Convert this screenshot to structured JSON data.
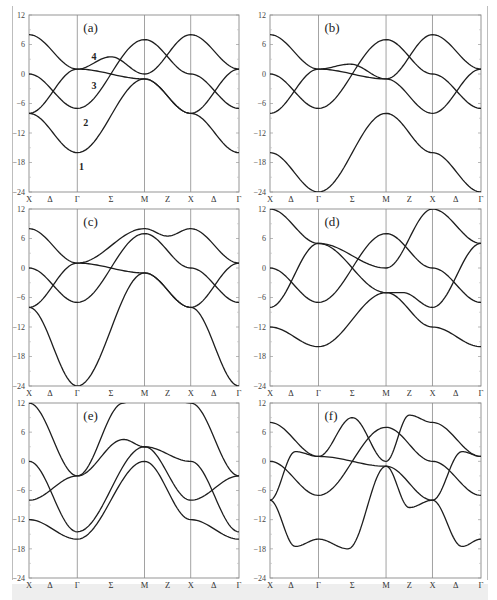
{
  "figure": {
    "ylim": [
      -24,
      12
    ],
    "yticks": [
      12,
      6,
      0,
      -6,
      -12,
      -18,
      -24
    ],
    "ytick_labels": [
      "12",
      "6",
      "0",
      "−6",
      "−12",
      "−18",
      "−24"
    ],
    "k_labels": [
      "X",
      "Δ",
      "Γ",
      "Σ",
      "M",
      "Z",
      "X",
      "Δ",
      "Γ"
    ],
    "k_positions": [
      0,
      0.1,
      0.23,
      0.39,
      0.55,
      0.66,
      0.77,
      0.88,
      1.0
    ],
    "high_symmetry_lines": [
      0.23,
      0.55,
      0.77
    ]
  },
  "chart_data": [
    {
      "type": "line",
      "title": "(a)",
      "xlabel": "",
      "ylabel": "",
      "ylim": [
        -24,
        12
      ],
      "x_ticks": [
        "X",
        "Δ",
        "Γ",
        "Σ",
        "M",
        "Z",
        "X",
        "Δ",
        "Γ"
      ],
      "annotations": [
        {
          "text": "1",
          "x": 0.25,
          "y": -19
        },
        {
          "text": "2",
          "x": 0.27,
          "y": -10
        },
        {
          "text": "3",
          "x": 0.31,
          "y": -2.5
        },
        {
          "text": "4",
          "x": 0.31,
          "y": 3.5
        }
      ],
      "series": [
        {
          "name": "band 1",
          "x": [
            0,
            0.23,
            0.55,
            0.77,
            1.0
          ],
          "y": [
            -8,
            -16,
            -1,
            -8,
            -16
          ]
        },
        {
          "name": "band 2",
          "x": [
            0,
            0.23,
            0.55,
            0.77,
            1.0
          ],
          "y": [
            0,
            -7,
            7,
            0,
            -7
          ]
        },
        {
          "name": "band 3",
          "x": [
            0,
            0.23,
            0.55,
            0.77,
            1.0
          ],
          "y": [
            -8,
            1,
            -1,
            -8,
            1
          ]
        },
        {
          "name": "band 4",
          "x": [
            0,
            0.23,
            0.39,
            0.55,
            0.77,
            1.0
          ],
          "y": [
            8,
            1,
            3.5,
            0,
            8,
            1
          ]
        }
      ]
    },
    {
      "type": "line",
      "title": "(b)",
      "ylim": [
        -24,
        12
      ],
      "x_ticks": [
        "X",
        "Δ",
        "Γ",
        "Σ",
        "M",
        "Z",
        "X",
        "Δ",
        "Γ"
      ],
      "series": [
        {
          "name": "band 1",
          "x": [
            0,
            0.23,
            0.55,
            0.77,
            1.0
          ],
          "y": [
            -16,
            -24,
            -8,
            -16,
            -24
          ]
        },
        {
          "name": "band 2",
          "x": [
            0,
            0.23,
            0.55,
            0.77,
            1.0
          ],
          "y": [
            0,
            -7,
            7,
            0,
            -7
          ]
        },
        {
          "name": "band 3",
          "x": [
            0,
            0.23,
            0.55,
            0.77,
            1.0
          ],
          "y": [
            -8,
            1,
            -1,
            -8,
            1
          ]
        },
        {
          "name": "band 4",
          "x": [
            0,
            0.23,
            0.38,
            0.55,
            0.77,
            1.0
          ],
          "y": [
            8,
            1,
            2,
            -1,
            8,
            1
          ]
        }
      ]
    },
    {
      "type": "line",
      "title": "(c)",
      "ylim": [
        -24,
        12
      ],
      "x_ticks": [
        "X",
        "Δ",
        "Γ",
        "Σ",
        "M",
        "Z",
        "X",
        "Δ",
        "Γ"
      ],
      "series": [
        {
          "name": "band 1",
          "x": [
            0,
            0.23,
            0.55,
            0.77,
            1.0
          ],
          "y": [
            -8,
            -24,
            -1,
            -8,
            -24
          ]
        },
        {
          "name": "band 2",
          "x": [
            0,
            0.23,
            0.55,
            0.77,
            1.0
          ],
          "y": [
            0,
            -7,
            7,
            0,
            -7
          ]
        },
        {
          "name": "band 3",
          "x": [
            0,
            0.23,
            0.55,
            0.77,
            1.0
          ],
          "y": [
            -8,
            1,
            -1,
            -8,
            1
          ]
        },
        {
          "name": "band 4",
          "x": [
            0,
            0.23,
            0.55,
            0.66,
            0.77,
            1.0
          ],
          "y": [
            8,
            1,
            8,
            6.5,
            8,
            1
          ]
        }
      ]
    },
    {
      "type": "line",
      "title": "(d)",
      "ylim": [
        -24,
        12
      ],
      "x_ticks": [
        "X",
        "Δ",
        "Γ",
        "Σ",
        "M",
        "Z",
        "X",
        "Δ",
        "Γ"
      ],
      "series": [
        {
          "name": "band 1",
          "x": [
            0,
            0.23,
            0.55,
            0.77,
            1.0
          ],
          "y": [
            -12,
            -16,
            -5,
            -12,
            -16
          ]
        },
        {
          "name": "band 2",
          "x": [
            0,
            0.23,
            0.55,
            0.77,
            1.0
          ],
          "y": [
            0,
            -7,
            7,
            0,
            -7
          ]
        },
        {
          "name": "band 3",
          "x": [
            0,
            0.23,
            0.55,
            0.63,
            0.77,
            1.0
          ],
          "y": [
            -8,
            5,
            -5,
            -5,
            -8,
            5
          ]
        },
        {
          "name": "band 4",
          "x": [
            0,
            0.23,
            0.55,
            0.77,
            1.0
          ],
          "y": [
            12,
            5,
            0,
            12,
            5
          ]
        }
      ]
    },
    {
      "type": "line",
      "title": "(e)",
      "ylim": [
        -24,
        12
      ],
      "x_ticks": [
        "X",
        "Δ",
        "Γ",
        "Σ",
        "M",
        "Z",
        "X",
        "Δ",
        "Γ"
      ],
      "series": [
        {
          "name": "band 1",
          "x": [
            0,
            0.23,
            0.55,
            0.77,
            1.0
          ],
          "y": [
            -12,
            -16,
            0,
            -12,
            -16
          ]
        },
        {
          "name": "band 2",
          "x": [
            0,
            0.23,
            0.55,
            0.77,
            1.0
          ],
          "y": [
            0,
            -14.5,
            3,
            -8,
            -3
          ]
        },
        {
          "name": "band 3",
          "x": [
            0,
            0.23,
            0.45,
            0.55,
            0.77,
            1.0
          ],
          "y": [
            -8,
            -3,
            4.5,
            3,
            0,
            -14.5
          ]
        },
        {
          "name": "band 4",
          "x": [
            0,
            0.23,
            0.45,
            0.55,
            0.77,
            1.0
          ],
          "y": [
            12,
            -3,
            12,
            16,
            12,
            -3
          ]
        }
      ]
    },
    {
      "type": "line",
      "title": "(f)",
      "ylim": [
        -24,
        12
      ],
      "x_ticks": [
        "X",
        "Δ",
        "Γ",
        "Σ",
        "M",
        "Z",
        "X",
        "Δ",
        "Γ"
      ],
      "series": [
        {
          "name": "band 1",
          "x": [
            0,
            0.12,
            0.23,
            0.37,
            0.55,
            0.77,
            0.91,
            1.0
          ],
          "y": [
            -8,
            -17.5,
            -16,
            -18,
            -1,
            -8,
            -17.5,
            -16
          ]
        },
        {
          "name": "band 2",
          "x": [
            0,
            0.23,
            0.55,
            0.77,
            1.0
          ],
          "y": [
            0,
            -7,
            7,
            0,
            -7
          ]
        },
        {
          "name": "band 3",
          "x": [
            0,
            0.12,
            0.23,
            0.55,
            0.66,
            0.77,
            0.91,
            1.0
          ],
          "y": [
            -8,
            2,
            1,
            -1,
            -9.5,
            -8,
            2,
            1
          ]
        },
        {
          "name": "band 4",
          "x": [
            0,
            0.23,
            0.39,
            0.55,
            0.66,
            0.77,
            1.0
          ],
          "y": [
            8,
            1,
            9,
            0,
            9.5,
            8,
            1
          ]
        }
      ]
    }
  ]
}
